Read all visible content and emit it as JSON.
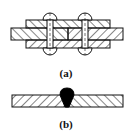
{
  "figure_a": {
    "label": "(a)",
    "description": "riveted butt joint with double cover plates",
    "rivets": 2
  },
  "figure_b": {
    "label": "(b)",
    "description": "welded butt joint"
  },
  "colors": {
    "line": "#111111",
    "background": "#ffffff",
    "weld": "#000000"
  }
}
